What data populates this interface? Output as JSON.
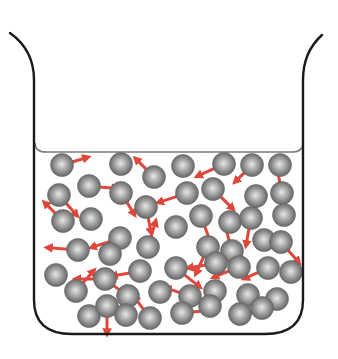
{
  "diagram": {
    "colors": {
      "beaker_outline": "#1a1a1a",
      "liquid_surface": "#7a7a7a",
      "liquid_fill": "#ffffff",
      "particle_light": "#e8e8e8",
      "particle_mid": "#9a9a9a",
      "particle_dark": "#5a5a5a",
      "arrow": "#e0463a"
    },
    "particle_radius": 11.5,
    "particles": [
      {
        "x": 62,
        "y": 165,
        "dx": 20,
        "dy": -6
      },
      {
        "x": 121,
        "y": 164,
        "dx": 0,
        "dy": 0
      },
      {
        "x": 154,
        "y": 177,
        "dx": -14,
        "dy": -14
      },
      {
        "x": 183,
        "y": 166,
        "dx": 0,
        "dy": 0
      },
      {
        "x": 224,
        "y": 164,
        "dx": -22,
        "dy": 10
      },
      {
        "x": 252,
        "y": 165,
        "dx": -12,
        "dy": 12
      },
      {
        "x": 280,
        "y": 165,
        "dx": 0,
        "dy": 0
      },
      {
        "x": 89,
        "y": 186,
        "dx": 22,
        "dy": 2
      },
      {
        "x": 59,
        "y": 195,
        "dx": 14,
        "dy": 16
      },
      {
        "x": 121,
        "y": 193,
        "dx": 10,
        "dy": 16
      },
      {
        "x": 146,
        "y": 207,
        "dx": 4,
        "dy": 20
      },
      {
        "x": 187,
        "y": 193,
        "dx": -24,
        "dy": 8
      },
      {
        "x": 213,
        "y": 189,
        "dx": 16,
        "dy": 16
      },
      {
        "x": 256,
        "y": 196,
        "dx": 0,
        "dy": 20
      },
      {
        "x": 282,
        "y": 193,
        "dx": -4,
        "dy": -20
      },
      {
        "x": 63,
        "y": 221,
        "dx": -14,
        "dy": -14
      },
      {
        "x": 91,
        "y": 219,
        "dx": 0,
        "dy": 0
      },
      {
        "x": 120,
        "y": 238,
        "dx": -24,
        "dy": 8
      },
      {
        "x": 148,
        "y": 247,
        "dx": 6,
        "dy": -20
      },
      {
        "x": 176,
        "y": 227,
        "dx": 0,
        "dy": 0
      },
      {
        "x": 201,
        "y": 216,
        "dx": 8,
        "dy": 22
      },
      {
        "x": 230,
        "y": 222,
        "dx": 0,
        "dy": 0
      },
      {
        "x": 251,
        "y": 218,
        "dx": -4,
        "dy": 22
      },
      {
        "x": 284,
        "y": 215,
        "dx": 0,
        "dy": 0
      },
      {
        "x": 78,
        "y": 250,
        "dx": -26,
        "dy": -2
      },
      {
        "x": 110,
        "y": 254,
        "dx": 0,
        "dy": 0
      },
      {
        "x": 208,
        "y": 247,
        "dx": -10,
        "dy": 22
      },
      {
        "x": 232,
        "y": 251,
        "dx": -6,
        "dy": -22
      },
      {
        "x": 264,
        "y": 240,
        "dx": 0,
        "dy": 0
      },
      {
        "x": 281,
        "y": 242,
        "dx": 14,
        "dy": 16
      },
      {
        "x": 56,
        "y": 275,
        "dx": 0,
        "dy": 0
      },
      {
        "x": 105,
        "y": 279,
        "dx": -24,
        "dy": 0
      },
      {
        "x": 140,
        "y": 271,
        "dx": -22,
        "dy": 4
      },
      {
        "x": 176,
        "y": 268,
        "dx": 20,
        "dy": 16
      },
      {
        "x": 216,
        "y": 263,
        "dx": -22,
        "dy": 4
      },
      {
        "x": 239,
        "y": 267,
        "dx": -20,
        "dy": 8
      },
      {
        "x": 268,
        "y": 268,
        "dx": -18,
        "dy": 8
      },
      {
        "x": 291,
        "y": 272,
        "dx": 0,
        "dy": 0
      },
      {
        "x": 76,
        "y": 291,
        "dx": 14,
        "dy": -16
      },
      {
        "x": 128,
        "y": 296,
        "dx": -14,
        "dy": -10
      },
      {
        "x": 160,
        "y": 292,
        "dx": 0,
        "dy": 0
      },
      {
        "x": 190,
        "y": 296,
        "dx": -18,
        "dy": -6
      },
      {
        "x": 215,
        "y": 291,
        "dx": 0,
        "dy": 0
      },
      {
        "x": 248,
        "y": 295,
        "dx": -6,
        "dy": 22
      },
      {
        "x": 277,
        "y": 299,
        "dx": -20,
        "dy": 10
      },
      {
        "x": 89,
        "y": 316,
        "dx": 0,
        "dy": 0
      },
      {
        "x": 107,
        "y": 306,
        "dx": 0,
        "dy": 22
      },
      {
        "x": 126,
        "y": 315,
        "dx": 0,
        "dy": -22
      },
      {
        "x": 150,
        "y": 318,
        "dx": -12,
        "dy": -16
      },
      {
        "x": 182,
        "y": 313,
        "dx": 22,
        "dy": -2
      },
      {
        "x": 210,
        "y": 306,
        "dx": 0,
        "dy": 0
      },
      {
        "x": 240,
        "y": 314,
        "dx": 0,
        "dy": 0
      },
      {
        "x": 262,
        "y": 308,
        "dx": -20,
        "dy": 10
      }
    ]
  }
}
